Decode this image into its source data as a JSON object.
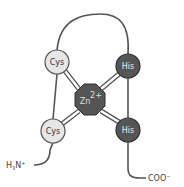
{
  "diagram": {
    "metal": {
      "label": "Zn",
      "charge": "2+",
      "fill": "#555555",
      "text_color": "#dddddd"
    },
    "residues": [
      {
        "id": "cys-top",
        "label": "Cys",
        "fill": "#e6e6e6",
        "text_color": "#333333"
      },
      {
        "id": "his-top",
        "label": "His",
        "fill": "#555555",
        "text_color": "#eeeeee"
      },
      {
        "id": "cys-bottom",
        "label": "Cys",
        "fill": "#e6e6e6",
        "text_color": "#333333"
      },
      {
        "id": "his-bottom",
        "label": "His",
        "fill": "#555555",
        "text_color": "#eeeeee"
      }
    ],
    "n_terminus": {
      "main": "H",
      "sub": "3",
      "rest": "N",
      "sup": "+"
    },
    "c_terminus": {
      "main": "COO",
      "sup": "−"
    },
    "colors": {
      "backbone": "#555555",
      "bond": "#555555",
      "bond_inner": "#ffffff"
    }
  }
}
